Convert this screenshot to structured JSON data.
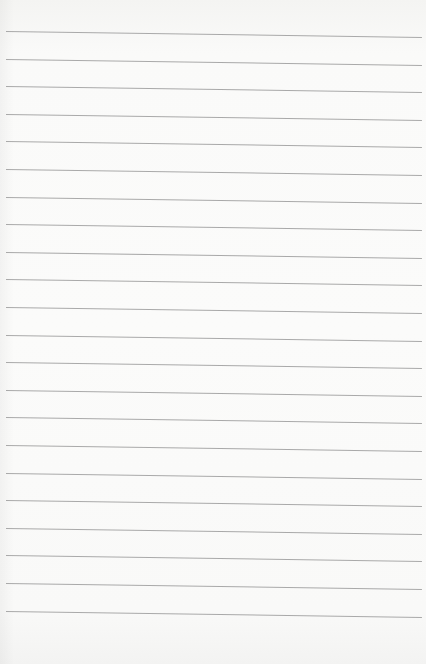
{
  "page": {
    "kind": "lined-paper",
    "background_color": "#fafaf9",
    "line_color": "#a9a9a9",
    "line_count": 22,
    "first_line_y": 31,
    "line_spacing": 27.6,
    "line_slope_px": 6
  }
}
